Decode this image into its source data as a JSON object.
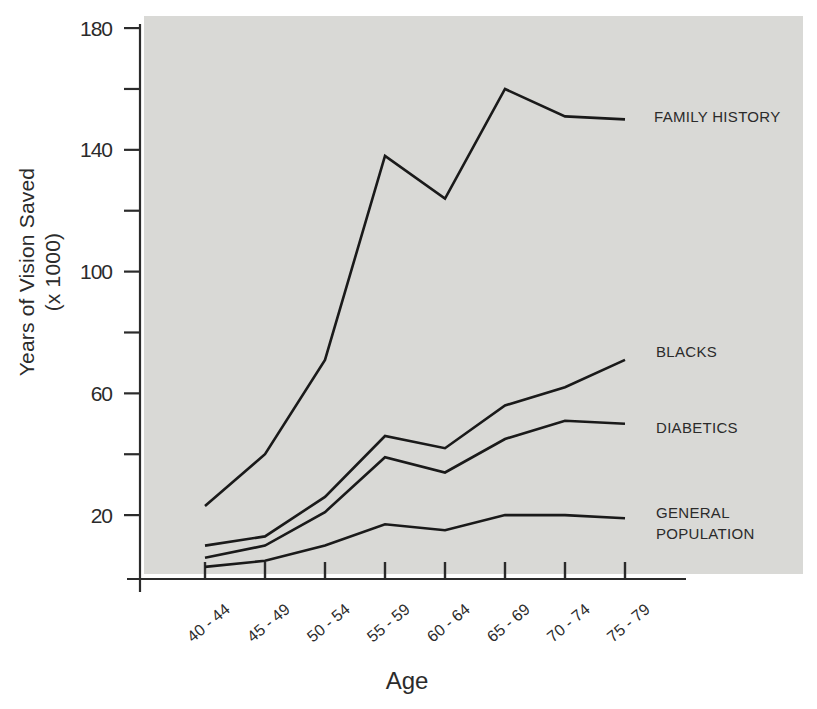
{
  "figure": {
    "y_axis_title_line1": "Years of Vision Saved",
    "y_axis_title_line2": "(x 1000)",
    "x_axis_title": "Age"
  },
  "chart_data": {
    "type": "line",
    "title": "",
    "xlabel": "Age",
    "ylabel": "Years of Vision Saved (x 1000)",
    "categories": [
      "40 - 44",
      "45 - 49",
      "50 - 54",
      "55 - 59",
      "60 - 64",
      "65 - 69",
      "70 - 74",
      "75 - 79"
    ],
    "series": [
      {
        "name": "FAMILY HISTORY",
        "values": [
          23,
          40,
          71,
          138,
          124,
          160,
          151,
          150
        ]
      },
      {
        "name": "BLACKS",
        "values": [
          10,
          13,
          26,
          46,
          42,
          56,
          62,
          71
        ]
      },
      {
        "name": "DIABETICS",
        "values": [
          6,
          10,
          21,
          39,
          34,
          45,
          51,
          50
        ]
      },
      {
        "name": "GENERAL POPULATION",
        "values": [
          3,
          5,
          10,
          17,
          15,
          20,
          20,
          19
        ]
      }
    ],
    "ylim": [
      0,
      180
    ],
    "y_major_ticks": [
      180,
      140,
      100,
      60,
      20
    ],
    "y_minor_ticks": [
      160,
      120,
      80,
      40
    ],
    "grid": false,
    "legend_position": "inline-right",
    "colors": {
      "line": "#1a1a1a",
      "axis": "#2b2b2b",
      "panel": "#d9d9d6",
      "text": "#2b2b2b",
      "background": "#ffffff"
    }
  }
}
